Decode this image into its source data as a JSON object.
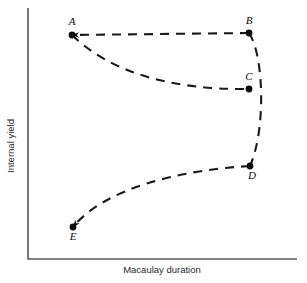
{
  "chart_data": {
    "type": "line",
    "title": "",
    "xlabel": "Macaulay duration",
    "ylabel": "Internal yield",
    "grid": false,
    "legend": null,
    "axes": {
      "x_axis_visible": true,
      "y_axis_visible": true,
      "x_ticks": [],
      "y_ticks": [],
      "xlim": null,
      "ylim": null,
      "note": "Qualitative schematic: axes are unlabeled and unscaled"
    },
    "points": [
      {
        "id": "A",
        "label": "A",
        "x": 0.16,
        "y": 0.89,
        "px": 72,
        "py": 35,
        "label_px": 72,
        "label_py": 25,
        "label_pos": "above"
      },
      {
        "id": "B",
        "label": "B",
        "x": 0.82,
        "y": 0.9,
        "px": 249,
        "py": 33,
        "label_px": 249,
        "label_py": 24,
        "label_pos": "above"
      },
      {
        "id": "C",
        "label": "C",
        "x": 0.82,
        "y": 0.68,
        "px": 249,
        "py": 89,
        "label_px": 249,
        "label_py": 80,
        "label_pos": "above"
      },
      {
        "id": "D",
        "label": "D",
        "x": 0.83,
        "y": 0.37,
        "px": 250,
        "py": 166,
        "label_px": 252,
        "label_py": 179,
        "label_pos": "below"
      },
      {
        "id": "E",
        "label": "E",
        "x": 0.17,
        "y": 0.13,
        "px": 73,
        "py": 227,
        "label_px": 73,
        "label_py": 240,
        "label_pos": "below"
      }
    ],
    "series": [
      {
        "name": "A-B",
        "from": "B",
        "to": "A",
        "style": "dashed",
        "arrow_at": "A",
        "shape": "straight",
        "path": "M 249 33 L 72 35"
      },
      {
        "name": "A-C",
        "from": "A",
        "to": "C",
        "style": "dashed",
        "arrow_at": null,
        "shape": "convex-decreasing",
        "path": "M 72 35 C 110 72, 170 90, 249 89"
      },
      {
        "name": "B-D",
        "from": "B",
        "to": "D",
        "style": "dashed",
        "arrow_at": null,
        "shape": "bulge-right",
        "path": "M 249 33 C 264 55, 266 130, 250 166"
      },
      {
        "name": "E-D",
        "from": "D",
        "to": "E",
        "style": "dashed",
        "arrow_at": "E",
        "shape": "concave-increasing",
        "path": "M 250 166 C 180 170, 105 188, 73 227"
      }
    ],
    "dash_pattern": "9 7"
  },
  "figure": {
    "xlabel": "Macaulay duration",
    "ylabel": "Internal yield",
    "background_color": "#ffffff",
    "axis_color": "#5a5a5a",
    "curve_color": "#1a1a1a",
    "point_color": "#0d0d0d"
  }
}
